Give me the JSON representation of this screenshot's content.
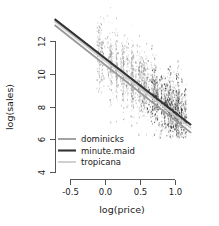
{
  "chart_data": {
    "type": "scatter",
    "title": "",
    "xlabel": "log(price)",
    "ylabel": "log(sales)",
    "xlim": [
      -0.75,
      1.25
    ],
    "ylim": [
      3.4,
      13.2
    ],
    "xticks": [
      -0.5,
      0.0,
      0.5,
      1.0
    ],
    "xticklabels": [
      "-0.5",
      "0.0",
      "0.5",
      "1.0"
    ],
    "yticks": [
      4,
      6,
      8,
      10,
      12
    ],
    "yticklabels": [
      "4",
      "6",
      "8",
      "10",
      "12"
    ],
    "grid": false,
    "legend_position": "bottom-left",
    "legend": [
      {
        "label": "dominicks",
        "color": "#999999"
      },
      {
        "label": "minute.maid",
        "color": "#333333"
      },
      {
        "label": "tropicana",
        "color": "#cccccc"
      }
    ],
    "series": [
      {
        "name": "dominicks",
        "color": "#999999",
        "kind": "regression-line",
        "intercept": 10.55,
        "slope": -3.38,
        "x_start": -0.72,
        "x_end": 1.23,
        "y_start": 12.98,
        "y_end": 6.39
      },
      {
        "name": "minute.maid",
        "color": "#333333",
        "kind": "regression-line",
        "intercept": 10.95,
        "slope": -3.32,
        "x_start": -0.72,
        "x_end": 1.23,
        "y_start": 13.34,
        "y_end": 6.87
      },
      {
        "name": "tropicana",
        "color": "#cccccc",
        "kind": "regression-line",
        "intercept": 10.8,
        "slope": -3.35,
        "x_start": -0.72,
        "x_end": 1.23,
        "y_start": 13.21,
        "y_end": 6.68
      }
    ],
    "scatter_description": {
      "point_color_light": "#c8c8c8",
      "point_color_mid": "#8a8a8a",
      "point_color_dark": "#2b2b2b",
      "x_range": [
        -0.2,
        1.15
      ],
      "y_range": [
        6.2,
        12.3
      ],
      "density_center_x": 0.82,
      "density_center_y": 8.7,
      "n_points": 2400
    }
  }
}
